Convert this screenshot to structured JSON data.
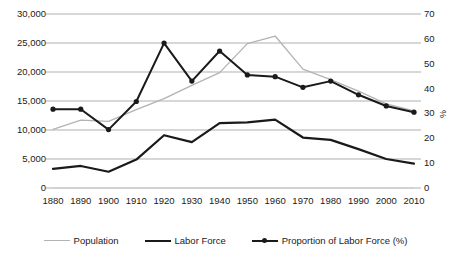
{
  "chart_data": {
    "type": "line",
    "title": "",
    "xlabel": "",
    "ylabel": "",
    "ylabel_right": "%",
    "grid": true,
    "legend_position": "bottom",
    "x": [
      1880,
      1890,
      1900,
      1910,
      1920,
      1930,
      1940,
      1950,
      1960,
      1970,
      1980,
      1990,
      2000,
      2010
    ],
    "categories": [
      "1880",
      "1890",
      "1900",
      "1910",
      "1920",
      "1930",
      "1940",
      "1950",
      "1960",
      "1970",
      "1980",
      "1990",
      "2000",
      "2010"
    ],
    "ylim": [
      0,
      30000
    ],
    "ylim_right": [
      0,
      70
    ],
    "yticks": [
      "0",
      "5,000",
      "10,000",
      "15,000",
      "20,000",
      "25,000",
      "30,000"
    ],
    "ytick_values": [
      0,
      5000,
      10000,
      15000,
      20000,
      25000,
      30000
    ],
    "yticks_right": [
      "0",
      "10",
      "20",
      "30",
      "40",
      "50",
      "60",
      "70"
    ],
    "ytick_values_right": [
      0,
      10,
      20,
      30,
      40,
      50,
      60,
      70
    ],
    "series": [
      {
        "name": "Population",
        "axis": "left",
        "color": "#b3b3b3",
        "width": 1.3,
        "markers": false,
        "values": [
          10100,
          11700,
          11500,
          13500,
          15400,
          17700,
          19900,
          24900,
          26200,
          20500,
          18700,
          16700,
          14500,
          13300
        ]
      },
      {
        "name": "Labor Force",
        "axis": "left",
        "color": "#1a1a1a",
        "width": 2.2,
        "markers": false,
        "values": [
          3300,
          3800,
          2800,
          4900,
          9100,
          7900,
          11200,
          11300,
          11800,
          8700,
          8300,
          6700,
          5000,
          4200
        ]
      },
      {
        "name": "Proportion of Labor Force (%)",
        "axis": "right",
        "color": "#1a1a1a",
        "width": 2.0,
        "markers": true,
        "values": [
          31.7,
          31.7,
          23.5,
          34.8,
          58.3,
          43.0,
          55.1,
          45.5,
          44.8,
          40.5,
          43.0,
          37.5,
          33.0,
          30.5
        ]
      }
    ]
  },
  "legend": {
    "items": [
      {
        "label": "Population",
        "color": "#b3b3b3",
        "width": 1.3,
        "marker": false
      },
      {
        "label": "Labor Force",
        "color": "#1a1a1a",
        "width": 2.4,
        "marker": false
      },
      {
        "label": "Proportion of Labor Force (%)",
        "color": "#1a1a1a",
        "width": 2.2,
        "marker": true
      }
    ]
  },
  "style": {
    "grid_color": "#a6a6a6",
    "background": "#ffffff",
    "text_color": "#1a1a1a"
  }
}
